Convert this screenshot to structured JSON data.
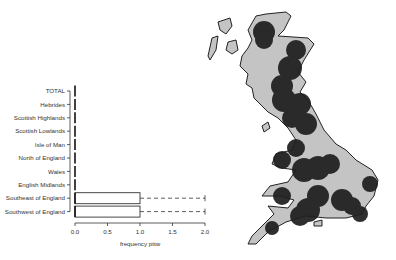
{
  "chart_data": [
    {
      "type": "boxplot",
      "orientation": "horizontal",
      "title": "",
      "xlabel": "frequency pttw",
      "ylabel": "",
      "xlim": [
        0.0,
        2.0
      ],
      "xticks": [
        "0.0",
        "0.5",
        "1.0",
        "1.5",
        "2.0"
      ],
      "categories": [
        "TOTAL",
        "Hebrides",
        "Scottish Highlands",
        "Scottish Lowlands",
        "Isle of Man",
        "North of England",
        "Wales",
        "English Midlands",
        "Southeast of England",
        "Southwest of England"
      ],
      "series": [
        {
          "name": "TOTAL",
          "min": 0,
          "q1": 0,
          "median": 0,
          "q3": 0,
          "max": 0
        },
        {
          "name": "Hebrides",
          "min": 0,
          "q1": 0,
          "median": 0,
          "q3": 0,
          "max": 0
        },
        {
          "name": "Scottish Highlands",
          "min": 0,
          "q1": 0,
          "median": 0,
          "q3": 0,
          "max": 0
        },
        {
          "name": "Scottish Lowlands",
          "min": 0,
          "q1": 0,
          "median": 0,
          "q3": 0,
          "max": 0
        },
        {
          "name": "Isle of Man",
          "min": 0,
          "q1": 0,
          "median": 0,
          "q3": 0,
          "max": 0
        },
        {
          "name": "North of England",
          "min": 0,
          "q1": 0,
          "median": 0,
          "q3": 0,
          "max": 0
        },
        {
          "name": "Wales",
          "min": 0,
          "q1": 0,
          "median": 0,
          "q3": 0,
          "max": 0
        },
        {
          "name": "English Midlands",
          "min": 0,
          "q1": 0,
          "median": 0,
          "q3": 0,
          "max": 0
        },
        {
          "name": "Southeast of England",
          "min": 0,
          "q1": 0,
          "median": 0,
          "q3": 1.0,
          "max": 2.0
        },
        {
          "name": "Southwest of England",
          "min": 0,
          "q1": 0,
          "median": 0,
          "q3": 1.0,
          "max": 2.0
        }
      ],
      "grid": false,
      "legend": null
    },
    {
      "type": "map",
      "region": "Great Britain",
      "description": "Grey land mass with dark circular hotspots indicating areas of higher frequency",
      "colors": {
        "land": "#c4c4c4",
        "hotspot": "#1e1e1e",
        "outline": "#222222",
        "background": "#ffffff"
      },
      "hotspots": [
        {
          "area": "Northwest Highlands"
        },
        {
          "area": "Northeast Scotland / Aberdeenshire"
        },
        {
          "area": "Central Scotland"
        },
        {
          "area": "Southern Scotland / Borders"
        },
        {
          "area": "Northeast England"
        },
        {
          "area": "Cumbria / Lancashire"
        },
        {
          "area": "North Wales"
        },
        {
          "area": "West Midlands"
        },
        {
          "area": "East Midlands"
        },
        {
          "area": "East Anglia coast"
        },
        {
          "area": "South Wales"
        },
        {
          "area": "Wessex / Dorset"
        },
        {
          "area": "London / Kent"
        },
        {
          "area": "Cornwall"
        }
      ]
    }
  ]
}
